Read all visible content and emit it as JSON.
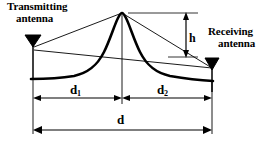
{
  "diagram": {
    "background_color": "#ffffff",
    "stroke_color": "#000000",
    "labels": {
      "transmitting_line1": "Transmitting",
      "transmitting_line2": "antenna",
      "receiving_line1": "Receiving",
      "receiving_line2": "antenna"
    },
    "dimensions": {
      "height_label": "h",
      "distance_left_label": "d",
      "distance_left_sub": "1",
      "distance_right_label": "d",
      "distance_right_sub": "2",
      "distance_total_label": "d"
    },
    "elements": {
      "transmitting_antenna": "transmitting-antenna",
      "receiving_antenna": "receiving-antenna",
      "obstacle": "terrain-peak",
      "ray_direct": "direct-ray",
      "ray_diffracted_left": "diffracted-ray-left",
      "ray_diffracted_right": "diffracted-ray-right"
    }
  }
}
